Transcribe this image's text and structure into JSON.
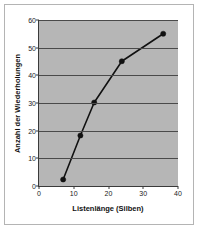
{
  "chart_data": {
    "type": "line",
    "title": "",
    "xlabel": "Listenlänge (Silben)",
    "ylabel": "Anzahl der Wiederholungen",
    "xlim": [
      0,
      40
    ],
    "ylim": [
      0,
      60
    ],
    "xticks": [
      0,
      10,
      20,
      30,
      40
    ],
    "yticks": [
      0,
      10,
      20,
      30,
      40,
      50,
      60
    ],
    "xtick_labels": [
      "0",
      "10",
      "20",
      "30",
      "40"
    ],
    "ytick_labels": [
      "0",
      "10",
      "20",
      "30",
      "40",
      "50",
      "60"
    ],
    "grid": "horizontal",
    "legend": "none",
    "plot_background": "#b6b6b6",
    "figure_background": "#ffffff",
    "series": [
      {
        "name": "Wiederholungen",
        "color": "#111111",
        "marker": "circle",
        "x": [
          7,
          12,
          16,
          24,
          36
        ],
        "y": [
          2,
          18,
          30,
          45,
          55
        ],
        "points": [
          {
            "x": 7,
            "y": 2
          },
          {
            "x": 12,
            "y": 18
          },
          {
            "x": 16,
            "y": 30
          },
          {
            "x": 24,
            "y": 45
          },
          {
            "x": 36,
            "y": 55
          }
        ]
      }
    ]
  }
}
